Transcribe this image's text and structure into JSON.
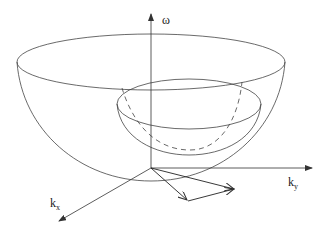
{
  "diagram": {
    "type": "3d-dispersion-surface",
    "axes": {
      "vertical": {
        "label": "ω",
        "sub": ""
      },
      "right": {
        "label": "k",
        "sub": "y"
      },
      "diagonal": {
        "label": "k",
        "sub": "x"
      }
    },
    "surfaces": [
      {
        "name": "outer-paraboloid",
        "style": "solid"
      },
      {
        "name": "inner-paraboloid",
        "style": "solid with dashed hidden contour"
      }
    ],
    "vectors": [
      {
        "name": "vector-k1",
        "from": "origin",
        "to": "lower-point"
      },
      {
        "name": "vector-k2",
        "from": "lower-point",
        "to": "right-point"
      },
      {
        "name": "vector-k3",
        "from": "origin",
        "to": "right-point"
      }
    ],
    "colors": {
      "stroke": "#333333",
      "background": "#ffffff"
    }
  }
}
